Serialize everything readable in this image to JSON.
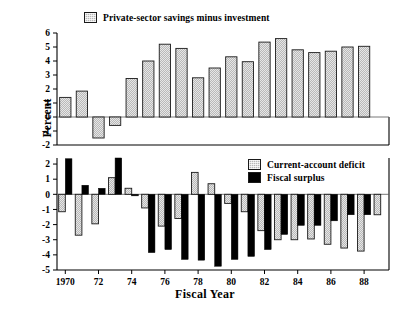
{
  "figure": {
    "ylabel": "Percent",
    "xlabel": "Fiscal Year"
  },
  "legend": {
    "top": {
      "label": "Private-sector savings minus investment",
      "swatch": "hatched-gray"
    },
    "bottom_1": {
      "label": "Current-account deficit",
      "swatch": "hatched-gray"
    },
    "bottom_2": {
      "label": "Fiscal surplus",
      "swatch": "solid-black"
    }
  },
  "colors": {
    "hatch_fill": "#b8b8b8",
    "solid_fill": "#000000",
    "outline": "#1a1a1a",
    "axis": "#000000",
    "background": "#ffffff"
  },
  "chart_data": [
    {
      "type": "bar",
      "id": "top-panel",
      "title": "",
      "xlabel": "",
      "ylabel": "Percent",
      "ylim": [
        -2,
        6
      ],
      "yticks": [
        -2,
        -1,
        0,
        1,
        2,
        3,
        4,
        5,
        6
      ],
      "yticklabels": [
        "-2",
        "-1",
        "0",
        "1",
        "2",
        "3",
        "4",
        "5",
        "6"
      ],
      "grid": false,
      "legend_position": "top-left-outside",
      "x": [
        1970,
        1971,
        1972,
        1973,
        1974,
        1975,
        1976,
        1977,
        1978,
        1979,
        1980,
        1981,
        1982,
        1983,
        1984,
        1985,
        1986,
        1987,
        1988,
        1989
      ],
      "series": [
        {
          "name": "Private-sector savings minus investment",
          "values": [
            1.4,
            1.85,
            -1.5,
            -0.6,
            2.75,
            4.0,
            5.2,
            4.9,
            2.8,
            3.5,
            4.3,
            3.95,
            5.35,
            5.6,
            4.8,
            4.6,
            4.7,
            5.0,
            5.05,
            null
          ]
        }
      ]
    },
    {
      "type": "bar",
      "id": "bottom-panel",
      "title": "",
      "xlabel": "Fiscal Year",
      "ylabel": "Percent",
      "ylim": [
        -5,
        2.4
      ],
      "yticks": [
        2,
        1,
        0,
        -1,
        -2,
        -3,
        -4,
        -5
      ],
      "yticklabels": [
        "2",
        "1",
        "0",
        "-1",
        "-2",
        "-3",
        "-4",
        "-5"
      ],
      "grid": false,
      "legend_position": "top-right-inside",
      "x": [
        1970,
        1971,
        1972,
        1973,
        1974,
        1975,
        1976,
        1977,
        1978,
        1979,
        1980,
        1981,
        1982,
        1983,
        1984,
        1985,
        1986,
        1987,
        1988,
        1989
      ],
      "series": [
        {
          "name": "Current-account deficit",
          "values": [
            -1.15,
            -2.7,
            -1.95,
            1.1,
            0.4,
            -0.9,
            -2.1,
            -1.6,
            1.45,
            0.7,
            -0.6,
            -1.15,
            -2.4,
            -3.0,
            -3.0,
            -2.95,
            -3.3,
            -3.55,
            -3.75,
            -1.35
          ]
        },
        {
          "name": "Fiscal surplus",
          "values": [
            2.35,
            0.6,
            0.4,
            2.4,
            -0.1,
            -3.85,
            -3.65,
            -4.3,
            -4.35,
            -4.75,
            -4.3,
            -4.1,
            -3.65,
            -2.65,
            -2.05,
            -2.05,
            -1.75,
            -1.35,
            -1.35,
            null
          ]
        }
      ]
    }
  ],
  "xaxis": {
    "ticks": [
      1970,
      1972,
      1974,
      1976,
      1978,
      1980,
      1982,
      1984,
      1986,
      1988
    ],
    "ticklabels": [
      "1970",
      "72",
      "74",
      "76",
      "78",
      "80",
      "82",
      "84",
      "86",
      "88"
    ]
  }
}
